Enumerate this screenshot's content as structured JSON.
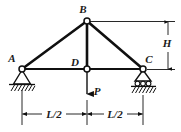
{
  "figure": {
    "joints": [
      {
        "id": "A",
        "label": "A",
        "x": 22,
        "y": 69,
        "role": "pin-support-joint",
        "label_x": 12,
        "label_y": 62
      },
      {
        "id": "B",
        "label": "B",
        "x": 87,
        "y": 21,
        "role": "apex-joint",
        "label_x": 83,
        "label_y": 11
      },
      {
        "id": "C",
        "label": "C",
        "x": 143,
        "y": 69,
        "role": "roller-support-joint",
        "label_x": 148,
        "label_y": 62
      },
      {
        "id": "D",
        "label": "D",
        "x": 87,
        "y": 69,
        "role": "midspan-joint",
        "label_x": 79,
        "label_y": 64
      }
    ],
    "members": [
      {
        "from": "A",
        "to": "B",
        "name": "top-chord-left"
      },
      {
        "from": "B",
        "to": "C",
        "name": "top-chord-right"
      },
      {
        "from": "A",
        "to": "C",
        "name": "bottom-chord"
      },
      {
        "from": "B",
        "to": "D",
        "name": "vertical-web"
      }
    ],
    "load": {
      "label": "P",
      "label_x": 97,
      "label_y": 95,
      "applied_at": "D",
      "direction": "down",
      "tip_x": 87,
      "tip_y": 98
    },
    "dimensions": [
      {
        "name": "height-H",
        "label": "H",
        "label_x": 167,
        "label_y": 43,
        "orientation": "vertical"
      },
      {
        "name": "span-left",
        "label": "L/2",
        "label_x": 52,
        "label_y": 118,
        "orientation": "horizontal"
      },
      {
        "name": "span-right",
        "label": "L/2",
        "label_x": 114,
        "label_y": 118,
        "orientation": "horizontal"
      }
    ],
    "supports": [
      {
        "at": "A",
        "type": "pin",
        "name": "pin-support"
      },
      {
        "at": "C",
        "type": "roller",
        "name": "roller-support",
        "roller_count": 3
      }
    ],
    "colors": {
      "ink": "#101010",
      "background": "#ffffff",
      "joint_fill": "#ffffff"
    }
  }
}
